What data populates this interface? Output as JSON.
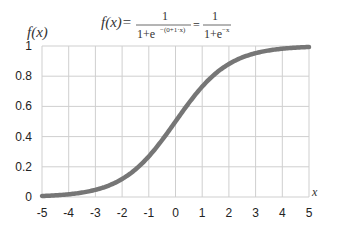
{
  "chart_data": {
    "type": "line",
    "formula": {
      "lhs": "f(x)=",
      "frac1_num": "1",
      "frac1_den": "1+e",
      "frac1_exp": "−(0+1·x)",
      "equals": "=",
      "frac2_num": "1",
      "frac2_den": "1+e",
      "frac2_exp": "−x"
    },
    "xlabel": "x",
    "ylabel": "f(x)",
    "xlim": [
      -5,
      5
    ],
    "ylim": [
      0,
      1
    ],
    "x_ticks": [
      "-5",
      "-4",
      "-3",
      "-2",
      "-1",
      "0",
      "1",
      "2",
      "3",
      "4",
      "5"
    ],
    "y_ticks": [
      "0",
      "0.2",
      "0.4",
      "0.6",
      "0.8",
      "1"
    ],
    "grid": true,
    "legend": "none",
    "series": [
      {
        "name": "sigmoid",
        "color": "#767676",
        "x": [
          -5,
          -4,
          -3,
          -2,
          -1,
          0,
          1,
          2,
          3,
          4,
          5
        ],
        "values": [
          0.0067,
          0.018,
          0.047,
          0.119,
          0.269,
          0.5,
          0.731,
          0.881,
          0.953,
          0.982,
          0.993
        ]
      }
    ]
  }
}
